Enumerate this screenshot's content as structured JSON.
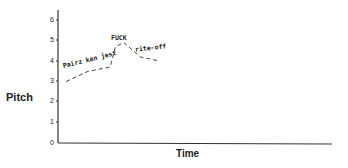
{
  "chart_data": {
    "type": "line",
    "title": "",
    "xlabel": "Time",
    "ylabel": "Pitch",
    "ylim": [
      0,
      6
    ],
    "yticks": [
      "0",
      "1",
      "2",
      "3",
      "4",
      "5",
      "6"
    ],
    "grid": false,
    "legend": null,
    "series": [
      {
        "name": "intonation contour",
        "style": "dashed",
        "points": [
          {
            "x": 0.03,
            "y": 3.0
          },
          {
            "x": 0.11,
            "y": 3.5
          },
          {
            "x": 0.19,
            "y": 3.7
          },
          {
            "x": 0.21,
            "y": 4.7
          },
          {
            "x": 0.24,
            "y": 4.9
          },
          {
            "x": 0.3,
            "y": 4.2
          },
          {
            "x": 0.37,
            "y": 4.0
          }
        ]
      }
    ],
    "annotations": [
      {
        "text": "Pairz kan jest",
        "near_y": 3.5
      },
      {
        "text": "FUCK",
        "near_y": 5.0
      },
      {
        "text": "rite-off",
        "near_y": 4.4
      }
    ]
  }
}
